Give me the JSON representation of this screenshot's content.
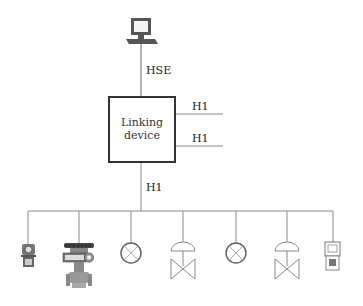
{
  "diagram": {
    "type": "fieldbus-network-topology",
    "host": {
      "name": "workstation",
      "icon": "computer-icon"
    },
    "links": {
      "host_to_linking": "HSE",
      "linking_right_1": "H1",
      "linking_right_2": "H1",
      "linking_to_bus": "H1"
    },
    "linking_device": {
      "line1": "Linking",
      "line2": "device"
    },
    "devices": [
      {
        "icon": "transmitter-icon"
      },
      {
        "icon": "control-valve-actuator-icon"
      },
      {
        "icon": "circle-x-instrument-icon"
      },
      {
        "icon": "diaphragm-valve-icon"
      },
      {
        "icon": "circle-x-instrument-icon"
      },
      {
        "icon": "diaphragm-valve-icon"
      },
      {
        "icon": "handheld-device-icon"
      }
    ],
    "colors": {
      "line": "#8a8a8a",
      "box": "#333333",
      "icon": "#666666"
    }
  }
}
